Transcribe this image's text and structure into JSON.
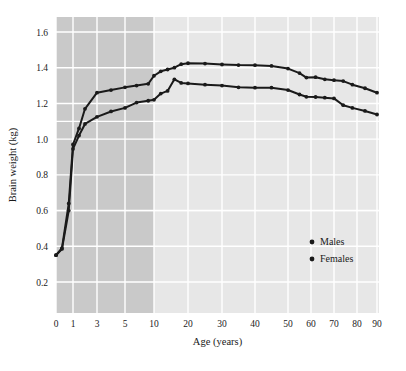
{
  "chart_data": {
    "type": "line",
    "title": "",
    "xlabel": "Age (years)",
    "ylabel": "Brain weight (kg)",
    "xticks": [
      0,
      1,
      3,
      5,
      10,
      20,
      30,
      40,
      50,
      60,
      70,
      80,
      90
    ],
    "xtick_labels": [
      "0",
      "1",
      "3",
      "5",
      "10",
      "20",
      "30",
      "40",
      "50",
      "60",
      "70",
      "80",
      "90"
    ],
    "yticks": [
      0.2,
      0.4,
      0.6,
      0.8,
      1.0,
      1.2,
      1.4,
      1.6
    ],
    "ytick_labels": [
      "0.2",
      "0.4",
      "0.6",
      "0.8",
      "1.0",
      "1.2",
      "1.4",
      "1.6"
    ],
    "ylim": [
      0.08,
      1.7
    ],
    "grid": true,
    "legend_position": "center-right",
    "shaded_band": {
      "x_from": 0,
      "x_to": 10,
      "color": "#c9c9c9",
      "note": "childhood region shaded darker"
    },
    "plot_background": "#e7e7e7",
    "gridline_color": "#ffffff",
    "line_color": "#1a1a1a",
    "series": [
      {
        "name": "Males",
        "marker": "dot",
        "x": [
          0,
          0.35,
          0.75,
          1,
          1.5,
          2,
          3,
          4,
          5,
          7,
          9,
          10,
          12,
          14,
          16,
          18,
          20,
          25,
          30,
          35,
          40,
          45,
          50,
          55,
          58,
          62,
          66,
          70,
          74,
          78,
          84,
          90
        ],
        "y": [
          0.35,
          0.39,
          0.64,
          0.97,
          1.06,
          1.17,
          1.26,
          1.275,
          1.29,
          1.3,
          1.31,
          1.355,
          1.38,
          1.39,
          1.4,
          1.42,
          1.425,
          1.423,
          1.418,
          1.415,
          1.414,
          1.41,
          1.395,
          1.37,
          1.345,
          1.347,
          1.335,
          1.33,
          1.325,
          1.305,
          1.285,
          1.26
        ]
      },
      {
        "name": "Females",
        "marker": "dot",
        "x": [
          0,
          0.35,
          0.75,
          1,
          1.5,
          2,
          3,
          4,
          5,
          7,
          9,
          10,
          12,
          14,
          16,
          18,
          20,
          25,
          30,
          35,
          40,
          45,
          50,
          55,
          58,
          62,
          66,
          70,
          74,
          78,
          84,
          90
        ],
        "y": [
          0.35,
          0.385,
          0.6,
          0.945,
          1.02,
          1.085,
          1.125,
          1.155,
          1.175,
          1.205,
          1.215,
          1.22,
          1.255,
          1.27,
          1.335,
          1.315,
          1.312,
          1.305,
          1.3,
          1.29,
          1.288,
          1.288,
          1.275,
          1.25,
          1.237,
          1.236,
          1.232,
          1.228,
          1.19,
          1.175,
          1.158,
          1.138
        ]
      }
    ],
    "legend": [
      {
        "label": "Males",
        "marker": "dot",
        "color": "#1a1a1a"
      },
      {
        "label": "Females",
        "marker": "dot",
        "color": "#1a1a1a"
      }
    ]
  }
}
